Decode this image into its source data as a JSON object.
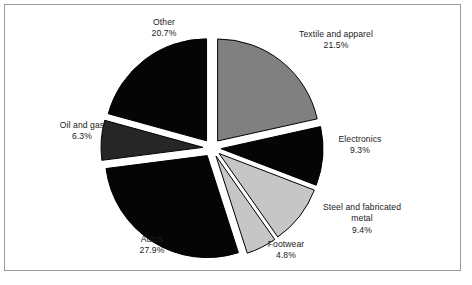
{
  "figure": {
    "frame_color": "#9a9a9a",
    "background": "#ffffff"
  },
  "chart_data": {
    "type": "pie",
    "title": "",
    "subtitle": "",
    "xlabel": "",
    "ylabel": "",
    "legend_position": "none",
    "grid": false,
    "exploded": true,
    "start_angle_deg": 0,
    "direction": "clockwise",
    "units": "percent",
    "categories": [
      "Textile and apparel",
      "Electronics",
      "Steel and fabricated metal",
      "Footwear",
      "Autos",
      "Oil and gas",
      "Other"
    ],
    "values": [
      21.5,
      9.3,
      9.4,
      4.8,
      27.9,
      6.3,
      20.7
    ],
    "value_labels": [
      "21.5%",
      "9.3%",
      "9.4%",
      "4.8%",
      "27.9%",
      "6.3%",
      "20.7%"
    ],
    "colors": [
      "#808080",
      "#050505",
      "#c6c6c6",
      "#c6c6c6",
      "#050505",
      "#262626",
      "#050505"
    ],
    "slices": [
      {
        "name": "Textile and apparel",
        "value": 21.5,
        "value_label": "21.5%",
        "color": "#808080",
        "edge": "#000000"
      },
      {
        "name": "Electronics",
        "value": 9.3,
        "value_label": "9.3%",
        "color": "#050505",
        "edge": "#000000"
      },
      {
        "name": "Steel and fabricated metal",
        "value": 9.4,
        "value_label": "9.4%",
        "color": "#c6c6c6",
        "edge": "#000000"
      },
      {
        "name": "Footwear",
        "value": 4.8,
        "value_label": "4.8%",
        "color": "#c6c6c6",
        "edge": "#000000"
      },
      {
        "name": "Autos",
        "value": 27.9,
        "value_label": "27.9%",
        "color": "#050505",
        "edge": "#000000"
      },
      {
        "name": "Oil and gas",
        "value": 6.3,
        "value_label": "6.3%",
        "color": "#262626",
        "edge": "#000000"
      },
      {
        "name": "Other",
        "value": 20.7,
        "value_label": "20.7%",
        "color": "#050505",
        "edge": "#000000"
      }
    ]
  },
  "labels": {
    "other": {
      "name": "Other",
      "value": "20.7%"
    },
    "textile": {
      "name": "Textile and apparel",
      "value": "21.5%"
    },
    "electronics": {
      "name": "Electronics",
      "value": "9.3%"
    },
    "steel": {
      "name": "Steel and fabricated",
      "name2": "metal",
      "value": "9.4%"
    },
    "footwear": {
      "name": "Footwear",
      "value": "4.8%"
    },
    "autos": {
      "name": "Autos",
      "value": "27.9%"
    },
    "oilgas": {
      "name": "Oil and gas",
      "value": "6.3%"
    }
  }
}
